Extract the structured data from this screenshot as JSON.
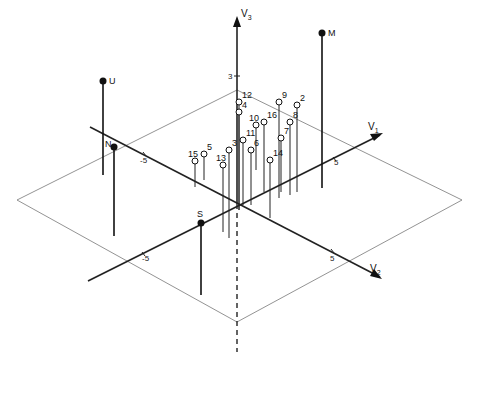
{
  "figure": {
    "type": "3d-biplot",
    "axes": {
      "v1": {
        "label": "V",
        "sub": "1",
        "ticks": [
          {
            "label": "-5"
          },
          {
            "label": "5"
          }
        ]
      },
      "v2": {
        "label": "V",
        "sub": "2",
        "ticks": [
          {
            "label": "-5"
          },
          {
            "label": "5"
          }
        ]
      },
      "v3": {
        "label": "V",
        "sub": "3",
        "ticks": [
          {
            "label": "3"
          }
        ]
      }
    },
    "filled_points": [
      {
        "label": "M",
        "x": 322,
        "y": 33,
        "base": 188
      },
      {
        "label": "U",
        "x": 103,
        "y": 81,
        "base": 175
      },
      {
        "label": "N",
        "x": 114,
        "y": 147,
        "base": 236
      },
      {
        "label": "S",
        "x": 201,
        "y": 223,
        "base": 295
      }
    ],
    "open_points": [
      {
        "label": "12",
        "x": 239,
        "y": 102,
        "base": 210
      },
      {
        "label": "4",
        "x": 239,
        "y": 112,
        "base": 210
      },
      {
        "label": "9",
        "x": 279,
        "y": 102,
        "base": 198
      },
      {
        "label": "2",
        "x": 297,
        "y": 105,
        "base": 192
      },
      {
        "label": "10",
        "x": 256,
        "y": 125,
        "base": 170
      },
      {
        "label": "16",
        "x": 264,
        "y": 122,
        "base": 192
      },
      {
        "label": "8",
        "x": 290,
        "y": 122,
        "base": 195
      },
      {
        "label": "11",
        "x": 243,
        "y": 140,
        "base": 205
      },
      {
        "label": "7",
        "x": 281,
        "y": 138,
        "base": 192
      },
      {
        "label": "6",
        "x": 251,
        "y": 150,
        "base": 205
      },
      {
        "label": "3",
        "x": 229,
        "y": 150,
        "base": 238
      },
      {
        "label": "5",
        "x": 204,
        "y": 154,
        "base": 180
      },
      {
        "label": "15",
        "x": 195,
        "y": 161,
        "base": 187
      },
      {
        "label": "13",
        "x": 223,
        "y": 165,
        "base": 232
      },
      {
        "label": "14",
        "x": 270,
        "y": 160,
        "base": 218
      }
    ]
  }
}
